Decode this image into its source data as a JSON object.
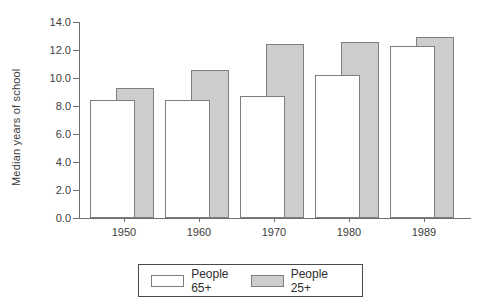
{
  "chart_data": {
    "type": "bar",
    "title": "",
    "xlabel": "",
    "ylabel": "Median years of school",
    "categories": [
      "1950",
      "1960",
      "1970",
      "1980",
      "1989"
    ],
    "series": [
      {
        "name": "People 65+",
        "fill": "#ffffff",
        "values": [
          8.4,
          8.4,
          8.7,
          10.2,
          12.3
        ]
      },
      {
        "name": "People 25+",
        "fill": "#cdcdcd",
        "values": [
          9.3,
          10.6,
          12.4,
          12.6,
          12.9
        ]
      }
    ],
    "ylim": [
      0,
      14
    ],
    "ytick_step": 2,
    "ytick_labels": [
      "0.0",
      "2.0",
      "4.0",
      "6.0",
      "8.0",
      "10.0",
      "12.0",
      "14.0"
    ],
    "grid": false,
    "legend_position": "bottom",
    "bar_style": "overlapping"
  }
}
